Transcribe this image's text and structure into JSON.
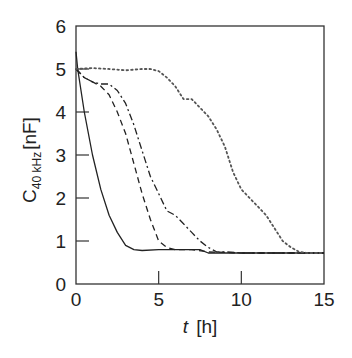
{
  "chart_data": {
    "type": "line",
    "title": "",
    "xlabel": "t [h]",
    "xlabel_var": "t",
    "xlabel_unit": "[h]",
    "ylabel": "C40kHz [nF]",
    "ylabel_main": "C",
    "ylabel_sub": "40 kHz",
    "ylabel_unit": "[nF]",
    "xlim": [
      0,
      15
    ],
    "ylim": [
      0,
      6
    ],
    "xticks": [
      0,
      5,
      10,
      15
    ],
    "yticks": [
      0,
      1,
      2,
      3,
      4,
      5,
      6
    ],
    "grid": false,
    "legend": "none",
    "series": [
      {
        "name": "solid",
        "style": "solid",
        "x": [
          0,
          0.1,
          0.5,
          1.0,
          1.5,
          2.0,
          2.5,
          3.0,
          3.5,
          4.0,
          5.0,
          6.0,
          7.0,
          7.5,
          8.0,
          9.0,
          10,
          12,
          15
        ],
        "y": [
          5.4,
          5.0,
          4.0,
          3.0,
          2.2,
          1.6,
          1.2,
          0.9,
          0.8,
          0.78,
          0.8,
          0.8,
          0.8,
          0.8,
          0.72,
          0.72,
          0.72,
          0.72,
          0.72
        ]
      },
      {
        "name": "dashed",
        "style": "dashed",
        "x": [
          0,
          0.5,
          1.0,
          1.5,
          2.0,
          2.5,
          3.0,
          3.5,
          4.0,
          4.5,
          5.0,
          5.5,
          6.0,
          7.0,
          8.0,
          10,
          12,
          15
        ],
        "y": [
          5.0,
          4.8,
          4.7,
          4.6,
          4.4,
          4.0,
          3.5,
          2.8,
          2.1,
          1.5,
          1.0,
          0.85,
          0.8,
          0.8,
          0.75,
          0.72,
          0.72,
          0.72
        ]
      },
      {
        "name": "dash-dot",
        "style": "dash-dot",
        "x": [
          0,
          0.5,
          1.0,
          1.5,
          2.0,
          2.5,
          3.0,
          3.5,
          4.0,
          4.5,
          5.0,
          5.5,
          6.0,
          6.5,
          7.0,
          7.5,
          8.0,
          8.5,
          9.0,
          10,
          12,
          15
        ],
        "y": [
          5.0,
          4.8,
          4.7,
          4.65,
          4.65,
          4.5,
          4.2,
          3.7,
          3.1,
          2.5,
          2.1,
          1.7,
          1.6,
          1.4,
          1.2,
          1.0,
          0.85,
          0.75,
          0.75,
          0.72,
          0.72,
          0.72
        ]
      },
      {
        "name": "dotted",
        "style": "dotted",
        "x": [
          0,
          1,
          2,
          3,
          4,
          4.5,
          5.0,
          5.5,
          6.0,
          6.5,
          7.0,
          7.5,
          8.0,
          8.5,
          9.0,
          9.5,
          10.0,
          10.5,
          11.0,
          11.5,
          12.0,
          12.5,
          13.0,
          13.5,
          14.0,
          15.0
        ],
        "y": [
          5.0,
          5.02,
          5.0,
          4.97,
          5.0,
          5.0,
          4.95,
          4.8,
          4.6,
          4.3,
          4.3,
          4.1,
          3.9,
          3.6,
          3.2,
          2.6,
          2.2,
          2.0,
          1.8,
          1.6,
          1.3,
          1.0,
          0.85,
          0.75,
          0.72,
          0.72
        ]
      }
    ]
  }
}
